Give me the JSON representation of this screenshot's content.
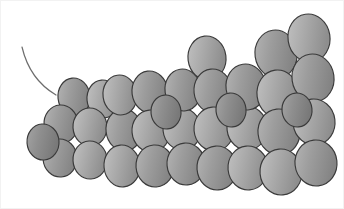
{
  "figure": {
    "width": 344,
    "height": 209,
    "background_color": "#ffffff",
    "border_color": "#f2f2f2",
    "atom_outline_color": "#3a3a3a",
    "atom_fill_light": "#b4b4b4",
    "atom_fill_mid": "#9a9a9a",
    "atom_fill_dark": "#7e7e7e",
    "bond_color": "#4a4a4a",
    "tail_color": "#6d6d6d",
    "atom_count": 34,
    "bond_count": 14
  },
  "tail": {
    "name": "bond-tail",
    "path": "M 22 47 C 26 64, 34 82, 56 95"
  },
  "bonds": [
    {
      "name": "bond-1",
      "x1": 62,
      "y1": 132,
      "x2": 96,
      "y2": 133
    },
    {
      "name": "bond-2",
      "x1": 96,
      "y1": 133,
      "x2": 130,
      "y2": 134
    },
    {
      "name": "bond-3",
      "x1": 130,
      "y1": 134,
      "x2": 164,
      "y2": 136
    },
    {
      "name": "bond-4",
      "x1": 164,
      "y1": 136,
      "x2": 200,
      "y2": 137
    },
    {
      "name": "bond-5",
      "x1": 200,
      "y1": 137,
      "x2": 236,
      "y2": 137
    },
    {
      "name": "bond-6",
      "x1": 236,
      "y1": 137,
      "x2": 272,
      "y2": 136
    },
    {
      "name": "bond-7",
      "x1": 272,
      "y1": 136,
      "x2": 306,
      "y2": 135
    },
    {
      "name": "bond-8",
      "x1": 64,
      "y1": 104,
      "x2": 98,
      "y2": 103
    },
    {
      "name": "bond-9",
      "x1": 98,
      "y1": 103,
      "x2": 132,
      "y2": 101
    },
    {
      "name": "bond-10",
      "x1": 132,
      "y1": 101,
      "x2": 166,
      "y2": 99
    },
    {
      "name": "bond-11",
      "x1": 166,
      "y1": 99,
      "x2": 200,
      "y2": 92
    },
    {
      "name": "bond-12",
      "x1": 200,
      "y1": 92,
      "x2": 234,
      "y2": 88
    },
    {
      "name": "bond-13",
      "x1": 234,
      "y1": 88,
      "x2": 268,
      "y2": 78
    },
    {
      "name": "bond-14",
      "x1": 268,
      "y1": 78,
      "x2": 296,
      "y2": 62
    }
  ],
  "atoms": [
    {
      "name": "atom-01",
      "cx": 74,
      "cy": 97,
      "rx": 16,
      "ry": 19,
      "rot": -6,
      "shade": "mid"
    },
    {
      "name": "atom-02",
      "cx": 103,
      "cy": 99,
      "rx": 16,
      "ry": 19,
      "rot": -5,
      "shade": "light"
    },
    {
      "name": "atom-03",
      "cx": 61,
      "cy": 124,
      "rx": 17,
      "ry": 19,
      "rot": -4,
      "shade": "mid"
    },
    {
      "name": "atom-04",
      "cx": 90,
      "cy": 127,
      "rx": 17,
      "ry": 19,
      "rot": -3,
      "shade": "light"
    },
    {
      "name": "atom-05",
      "cx": 60,
      "cy": 158,
      "rx": 17,
      "ry": 19,
      "rot": -4,
      "shade": "mid"
    },
    {
      "name": "atom-06",
      "cx": 90,
      "cy": 160,
      "rx": 17,
      "ry": 19,
      "rot": -3,
      "shade": "light"
    },
    {
      "name": "atom-07",
      "cx": 124,
      "cy": 130,
      "rx": 18,
      "ry": 21,
      "rot": -6,
      "shade": "mid"
    },
    {
      "name": "atom-08",
      "cx": 122,
      "cy": 166,
      "rx": 18,
      "ry": 21,
      "rot": -5,
      "shade": "light"
    },
    {
      "name": "atom-09",
      "cx": 120,
      "cy": 95,
      "rx": 17,
      "ry": 20,
      "rot": -8,
      "shade": "light"
    },
    {
      "name": "atom-10",
      "cx": 150,
      "cy": 92,
      "rx": 18,
      "ry": 21,
      "rot": -7,
      "shade": "mid"
    },
    {
      "name": "atom-11",
      "cx": 151,
      "cy": 131,
      "rx": 19,
      "ry": 21,
      "rot": -5,
      "shade": "light"
    },
    {
      "name": "atom-12",
      "cx": 155,
      "cy": 166,
      "rx": 19,
      "ry": 21,
      "rot": -4,
      "shade": "mid"
    },
    {
      "name": "atom-13",
      "cx": 182,
      "cy": 129,
      "rx": 19,
      "ry": 21,
      "rot": -6,
      "shade": "light"
    },
    {
      "name": "atom-14",
      "cx": 186,
      "cy": 164,
      "rx": 19,
      "ry": 21,
      "rot": -5,
      "shade": "mid"
    },
    {
      "name": "atom-15",
      "cx": 183,
      "cy": 90,
      "rx": 18,
      "ry": 21,
      "rot": -8,
      "shade": "mid"
    },
    {
      "name": "atom-16",
      "cx": 207,
      "cy": 58,
      "rx": 19,
      "ry": 22,
      "rot": -7,
      "shade": "light"
    },
    {
      "name": "atom-17",
      "cx": 213,
      "cy": 91,
      "rx": 19,
      "ry": 22,
      "rot": -6,
      "shade": "mid"
    },
    {
      "name": "atom-18",
      "cx": 214,
      "cy": 129,
      "rx": 20,
      "ry": 22,
      "rot": -5,
      "shade": "light"
    },
    {
      "name": "atom-19",
      "cx": 217,
      "cy": 168,
      "rx": 20,
      "ry": 22,
      "rot": -4,
      "shade": "mid"
    },
    {
      "name": "atom-20",
      "cx": 247,
      "cy": 128,
      "rx": 20,
      "ry": 22,
      "rot": -6,
      "shade": "light"
    },
    {
      "name": "atom-21",
      "cx": 246,
      "cy": 87,
      "rx": 20,
      "ry": 23,
      "rot": -8,
      "shade": "mid"
    },
    {
      "name": "atom-22",
      "cx": 248,
      "cy": 168,
      "rx": 20,
      "ry": 22,
      "rot": -5,
      "shade": "light"
    },
    {
      "name": "atom-23",
      "cx": 276,
      "cy": 54,
      "rx": 21,
      "ry": 24,
      "rot": -8,
      "shade": "mid"
    },
    {
      "name": "atom-24",
      "cx": 278,
      "cy": 94,
      "rx": 21,
      "ry": 24,
      "rot": -7,
      "shade": "light"
    },
    {
      "name": "atom-25",
      "cx": 279,
      "cy": 132,
      "rx": 21,
      "ry": 23,
      "rot": -6,
      "shade": "mid"
    },
    {
      "name": "atom-26",
      "cx": 281,
      "cy": 172,
      "rx": 21,
      "ry": 23,
      "rot": -5,
      "shade": "light"
    },
    {
      "name": "atom-27",
      "cx": 309,
      "cy": 38,
      "rx": 21,
      "ry": 24,
      "rot": -9,
      "shade": "light"
    },
    {
      "name": "atom-28",
      "cx": 313,
      "cy": 78,
      "rx": 21,
      "ry": 24,
      "rot": -8,
      "shade": "mid"
    },
    {
      "name": "atom-29",
      "cx": 314,
      "cy": 122,
      "rx": 21,
      "ry": 23,
      "rot": -7,
      "shade": "light"
    },
    {
      "name": "atom-30",
      "cx": 316,
      "cy": 163,
      "rx": 21,
      "ry": 23,
      "rot": -6,
      "shade": "mid"
    },
    {
      "name": "atom-31",
      "cx": 43,
      "cy": 142,
      "rx": 16,
      "ry": 18,
      "rot": -4,
      "shade": "dark"
    },
    {
      "name": "atom-32",
      "cx": 166,
      "cy": 112,
      "rx": 15,
      "ry": 17,
      "rot": -6,
      "shade": "dark"
    },
    {
      "name": "atom-33",
      "cx": 231,
      "cy": 110,
      "rx": 15,
      "ry": 17,
      "rot": -6,
      "shade": "dark"
    },
    {
      "name": "atom-34",
      "cx": 297,
      "cy": 110,
      "rx": 15,
      "ry": 17,
      "rot": -6,
      "shade": "dark"
    }
  ]
}
